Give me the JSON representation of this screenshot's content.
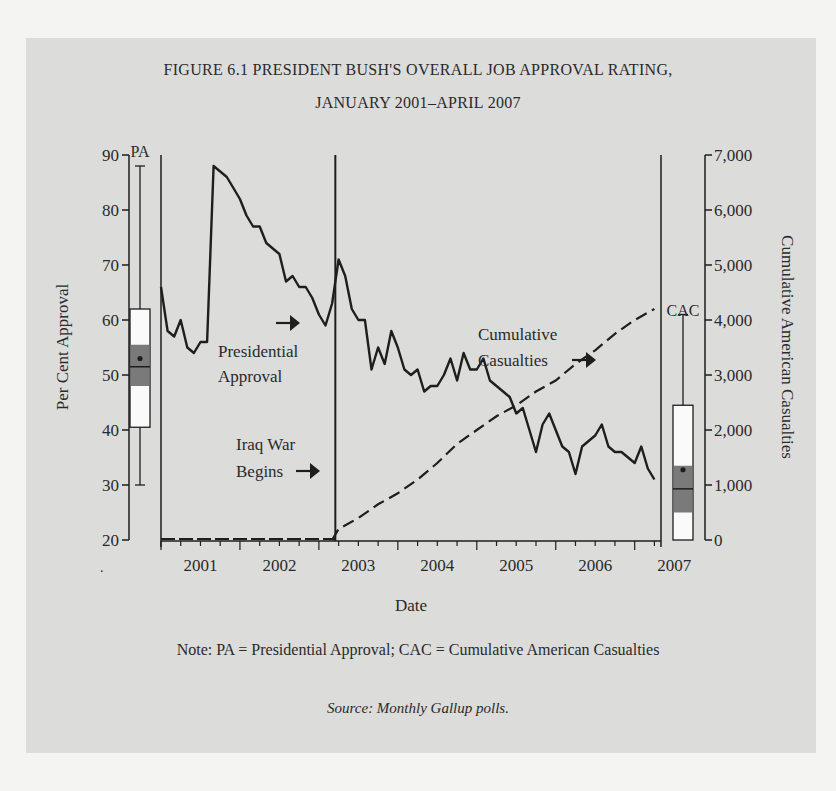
{
  "figure": {
    "title_line1": "FIGURE 6.1 PRESIDENT BUSH'S OVERALL JOB APPROVAL RATING,",
    "title_line2": "JANUARY 2001–APRIL 2007",
    "note": "Note: PA = Presidential Approval; CAC = Cumulative American Casualties",
    "source": "Source: Monthly Gallup polls."
  },
  "chart_data": {
    "type": "line",
    "xlabel": "Date",
    "ylabel_left": "Per Cent Approval",
    "ylabel_right": "Cumulative American Casualties",
    "x_ticks": [
      "2001",
      "2002",
      "2003",
      "2004",
      "2005",
      "2006",
      "2007"
    ],
    "y_left_ticks": [
      20,
      30,
      40,
      50,
      60,
      70,
      80,
      90
    ],
    "y_left_range": [
      20,
      90
    ],
    "y_right_ticks": [
      "0",
      "1,000",
      "2,000",
      "3,000",
      "4,000",
      "5,000",
      "6,000",
      "7,000"
    ],
    "y_right_range": [
      0,
      7000
    ],
    "grid": false,
    "annotations": [
      {
        "text": "Presidential Approval",
        "arrow": "right"
      },
      {
        "text": "Cumulative Casualties",
        "arrow": "right"
      },
      {
        "text": "Iraq War Begins",
        "arrow": "right",
        "event": "March 2003"
      }
    ],
    "series": [
      {
        "name": "Presidential Approval",
        "style": "solid",
        "axis": "left",
        "x_months_from_jan2001": [
          0,
          1,
          2,
          3,
          4,
          5,
          6,
          7,
          8,
          9,
          10,
          11,
          12,
          13,
          14,
          15,
          16,
          17,
          18,
          19,
          20,
          21,
          22,
          23,
          24,
          25,
          26,
          27,
          28,
          29,
          30,
          31,
          32,
          33,
          34,
          35,
          36,
          37,
          38,
          39,
          40,
          41,
          42,
          43,
          44,
          45,
          46,
          47,
          48,
          49,
          50,
          51,
          52,
          53,
          54,
          55,
          56,
          57,
          58,
          59,
          60,
          61,
          62,
          63,
          64,
          65,
          66,
          67,
          68,
          69,
          70,
          71,
          72,
          73,
          74,
          75
        ],
        "values": [
          66,
          58,
          57,
          60,
          55,
          54,
          56,
          56,
          88,
          87,
          86,
          84,
          82,
          79,
          77,
          77,
          74,
          73,
          72,
          67,
          68,
          66,
          66,
          64,
          61,
          59,
          63,
          71,
          68,
          62,
          60,
          60,
          51,
          55,
          52,
          58,
          55,
          51,
          50,
          51,
          47,
          48,
          48,
          50,
          53,
          49,
          54,
          51,
          51,
          53,
          49,
          48,
          47,
          46,
          43,
          44,
          40,
          36,
          41,
          43,
          40,
          37,
          36,
          32,
          37,
          38,
          39,
          41,
          37,
          36,
          36,
          35,
          34,
          37,
          33,
          31
        ]
      },
      {
        "name": "Cumulative Casualties",
        "style": "dashed",
        "axis": "right",
        "x_months_from_jan2001": [
          26,
          27,
          30,
          33,
          36,
          39,
          42,
          45,
          48,
          51,
          54,
          57,
          60,
          63,
          66,
          69,
          72,
          75
        ],
        "values": [
          0,
          200,
          400,
          650,
          850,
          1100,
          1400,
          1750,
          2000,
          2250,
          2450,
          2700,
          2900,
          3200,
          3450,
          3750,
          4000,
          4200
        ]
      }
    ],
    "boxplots": [
      {
        "name": "PA",
        "axis": "left",
        "min": 30,
        "q1": 40.5,
        "ci_low": 48,
        "median": 51.5,
        "ci_high": 55.5,
        "mean": 53,
        "q3": 62,
        "max": 88
      },
      {
        "name": "CAC",
        "axis": "right",
        "min": 0,
        "q1": 0,
        "ci_low": 500,
        "median": 930,
        "ci_high": 1350,
        "mean": 1350,
        "q3": 2450,
        "max": 4100
      }
    ]
  }
}
